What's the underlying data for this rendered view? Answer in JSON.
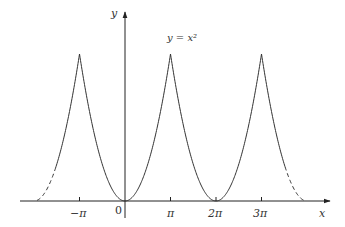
{
  "chart_data": {
    "type": "line",
    "title": "",
    "annotation": "y = x^2",
    "xlabel": "x",
    "ylabel": "y",
    "function": "periodic extension of y = x^2 on [-pi, pi], period 2*pi",
    "x_ticks": [
      {
        "value": "-pi",
        "label": "−π"
      },
      {
        "value": 0,
        "label": "0"
      },
      {
        "value": "pi",
        "label": "π"
      },
      {
        "value": "2pi",
        "label": "2π"
      },
      {
        "value": "3pi",
        "label": "3π"
      }
    ],
    "peaks": [
      {
        "x": "-pi",
        "y": "pi^2"
      },
      {
        "x": "pi",
        "y": "pi^2"
      },
      {
        "x": "3pi",
        "y": "pi^2"
      }
    ],
    "zeros": [
      0,
      "2pi"
    ],
    "solid_range": [
      "~ -1.5pi",
      "~ 3.5pi"
    ],
    "dashed_extensions": [
      [
        "~ -1.9pi",
        "~ -1.5pi"
      ],
      [
        "~ 3.5pi",
        "~ 3.9pi"
      ]
    ],
    "grid": false,
    "legend": null,
    "colors": {
      "curve": "#333333",
      "axes": "#222222"
    }
  },
  "labels": {
    "y_axis": "y",
    "x_axis": "x",
    "equation": "y = x²",
    "origin": "0",
    "tick_neg_pi": "−π",
    "tick_pi": "π",
    "tick_2pi": "2π",
    "tick_3pi": "3π"
  }
}
